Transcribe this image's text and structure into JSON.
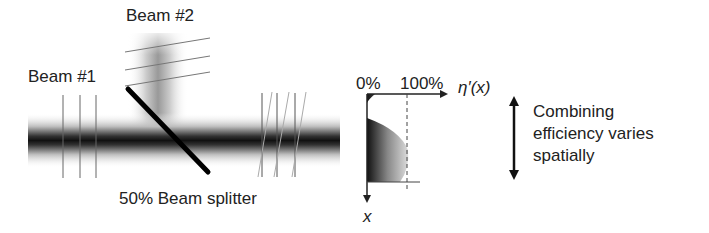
{
  "labels": {
    "beam1": "Beam #1",
    "beam2": "Beam #2",
    "splitter": "50% Beam splitter",
    "axis_0": "0%",
    "axis_100": "100%",
    "eta_axis": "η′(x)",
    "x_axis": "x",
    "note_line1": "Combining",
    "note_line2": "efficiency varies",
    "note_line3": "spatially"
  },
  "colors": {
    "ink": "#222222",
    "beam_dark": "#111111",
    "wavefront": "#666666"
  }
}
